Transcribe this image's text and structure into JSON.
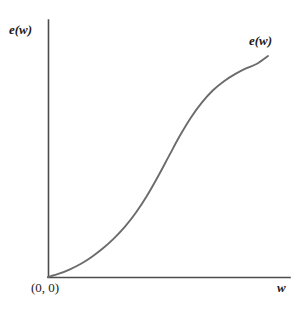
{
  "figure": {
    "background_color": "#ffffff",
    "axis_color": "#4d4d4d",
    "curve_color": "#6b6b6b",
    "text_color": "#1a1a1a"
  },
  "labels": {
    "y_axis": "e(w)",
    "x_axis": "w",
    "curve": "e(w)",
    "origin": "(0, 0)"
  },
  "chart_data": {
    "type": "line",
    "title": "",
    "xlabel": "w",
    "ylabel": "e(w)",
    "legend": [
      "e(w)"
    ],
    "grid": false,
    "legend_position": "curve-end-top-right",
    "annotations": [
      {
        "text": "(0, 0)",
        "x": 0,
        "y": 0,
        "placement": "below-left-of-origin"
      },
      {
        "text": "e(w)",
        "x": 1.0,
        "y": 1.0,
        "placement": "above-curve-end"
      }
    ],
    "xlim": [
      0,
      1.1
    ],
    "ylim": [
      0,
      1.05
    ],
    "axis_ticks": {
      "x": [],
      "y": []
    },
    "series": [
      {
        "name": "e(w)",
        "x": [
          0.0,
          0.05,
          0.1,
          0.15,
          0.2,
          0.25,
          0.3,
          0.35,
          0.4,
          0.45,
          0.5,
          0.55,
          0.6,
          0.65,
          0.7,
          0.75,
          0.8,
          0.85,
          0.9,
          0.95,
          1.0
        ],
        "y": [
          0.0,
          0.015,
          0.035,
          0.06,
          0.092,
          0.13,
          0.175,
          0.228,
          0.292,
          0.368,
          0.455,
          0.548,
          0.64,
          0.722,
          0.79,
          0.845,
          0.886,
          0.918,
          0.944,
          0.965,
          1.0
        ]
      }
    ]
  }
}
